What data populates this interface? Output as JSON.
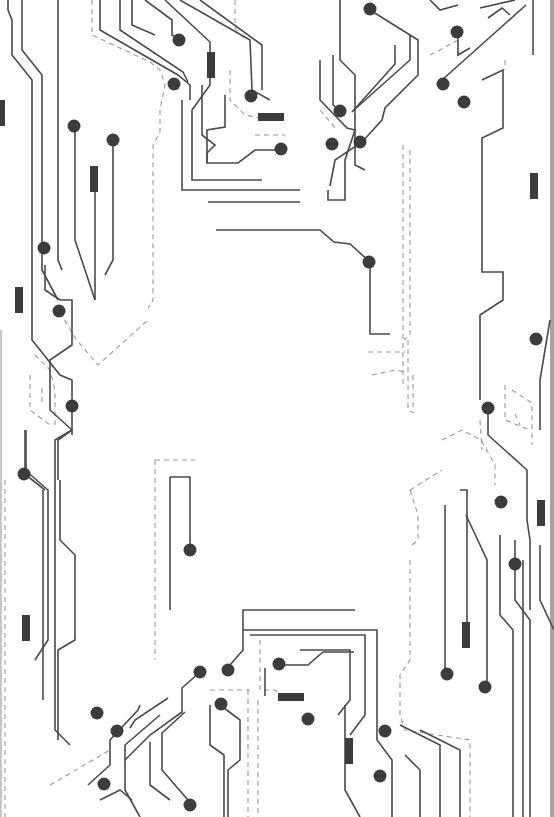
{
  "image": {
    "description": "Circuit board pattern decorative border",
    "width": 554,
    "height": 817,
    "colors": {
      "background": "#ffffff",
      "trace": "#4a4a4a",
      "dashed": "#9a9a9a",
      "node": "#3c3c3c"
    }
  },
  "traces": [
    "M22,0 L22,50 L42,75 L42,270 L58,300",
    "M8,0 L8,10 L12,20 L12,55 L32,80 L32,265",
    "M58,0 L58,260 L62,270",
    "M100,0 L100,30 L178,75 L190,85 L190,100",
    "M120,0 L120,30 L183,72 L188,82",
    "M132,0 L132,25 L155,35",
    "M145,0 L172,20 L172,35 L180,40",
    "M165,0 L210,42 L210,85 L192,110 L192,180 L262,180",
    "M180,0 L250,40 L252,90 L270,100",
    "M200,0 L262,45 L262,90",
    "M202,85 L202,135 L215,145 L207,153 L207,163 L238,163 L255,150 L282,150",
    "M225,95 L225,127 L207,130 L207,163",
    "M182,100 L182,190 L300,190",
    "M208,202 L300,202",
    "M216,230 L320,230 L334,242 L350,244 L370,262 L370,334 L390,334",
    "M75,126 L75,240 L95,300",
    "M113,140 L113,260 L105,275",
    "M95,180 L95,300",
    "M320,60 L320,100 L347,128 L355,130 L345,160 L345,200 L328,200 L328,190",
    "M333,55 L333,105 L345,115",
    "M340,0 L340,60 L355,75 L355,165 L365,170",
    "M370,10 L410,35 L410,60 L354,110",
    "M395,45 L395,64 L352,112",
    "M410,35 L418,40 L418,75 L385,108 L382,120 L362,142 L335,160 L330,186",
    "M442,80 L526,5",
    "M430,0 L440,10 L458,5",
    "M480,8 L515,0",
    "M488,18 L502,8 L510,15",
    "M458,30 L458,55 L470,48",
    "M533,0 L533,55",
    "M482,80 L503,70 L503,128 L482,138 L482,272 L503,272 L503,300 L480,315 L480,400",
    "M488,408 L488,435 L527,470 L527,520 L530,540 L530,610",
    "M550,320 L540,380 L540,430",
    "M45,265 L45,290 L60,300 L72,300 L72,345 L50,360 L50,410 L72,430 L72,435",
    "M32,265 L32,340 L60,375 L72,380 L72,430 L58,440 L58,480",
    "M72,430 L55,440 L55,730 L70,745",
    "M25,430 L25,470 L48,490 L48,640 L35,660",
    "M26,430 L26,475 L45,490",
    "M43,490 L43,700",
    "M60,480 L60,540 L75,555 L75,640 L58,650 L58,740",
    "M170,477 L190,477 L190,545",
    "M170,477 L170,610",
    "M230,665 L243,650 L243,610 L355,610",
    "M243,630 L377,630 L377,740 L392,760 L392,817",
    "M250,635 L365,635 L365,715 L350,735",
    "M300,650 L350,650 L350,700 L338,715",
    "M278,665 L308,665 L323,652 L354,652",
    "M265,696 L265,668",
    "M345,705 L345,790 L360,817",
    "M200,672 L182,688 L182,712 L150,735 L125,760",
    "M140,705 L138,710 L110,740 L110,765 L88,785",
    "M168,698 L135,720 L130,728",
    "M160,715 L125,745 L125,790 L140,817",
    "M150,742 L150,785 L170,800",
    "M185,712 L162,733 L162,770 L188,800",
    "M220,705 L240,720 L240,760 L228,770 L228,817",
    "M210,705 L210,745 L224,755 L224,817",
    "M100,800 L120,790 L132,800",
    "M400,725 L440,745 L440,817",
    "M405,755 L420,770 L420,817",
    "M420,730 L460,750 L460,817",
    "M445,505 L445,670",
    "M460,490 L467,490 L467,630",
    "M466,515 L487,560 L487,685",
    "M500,535 L500,615 L513,630 L513,817",
    "M515,540 L515,600 L530,620 L530,817",
    "M523,560 L523,817",
    "M540,545 L540,600 L554,630"
  ],
  "dashed_paths": [
    "M92,0 L92,35 L150,62 L160,70 L165,85 L160,110 L160,132 L153,145 L153,300 L148,308",
    "M235,0 L235,28 L245,40",
    "M230,70 L230,100 L245,115 L262,118",
    "M255,135 L285,135",
    "M60,312 L75,338 L98,365 L148,320",
    "M35,355 L50,370 L55,390 L55,425",
    "M30,375 L30,410 L50,425",
    "M42,388 L42,402",
    "M155,460 L195,460",
    "M155,460 L155,660",
    "M5,480 L5,817",
    "M320,110 L337,130",
    "M403,145 L403,385",
    "M410,150 L410,335 L404,340",
    "M408,340 L408,410 L418,415",
    "M368,352 L405,352",
    "M372,375 L395,370 L405,372",
    "M413,375 L413,410",
    "M442,440 L462,430 L481,440 L495,465 L495,485",
    "M410,490 L442,470",
    "M410,490 L418,515 L418,540 L412,545",
    "M505,385 L505,420 L530,430",
    "M512,390 L532,403 L532,445",
    "M515,414 L520,425",
    "M410,560 L410,660 L400,675 L400,715 L405,730 L470,740 L470,817",
    "M260,640 L260,690 L275,690 L285,700",
    "M248,690 L248,817",
    "M258,700 L258,817",
    "M50,785 L110,750",
    "M210,690 L250,690",
    "M480,420 L482,450",
    "M505,60 L505,70",
    "M430,55 L462,38"
  ],
  "nodes": [
    [
      179,
      40
    ],
    [
      370,
      9
    ],
    [
      457,
      32
    ],
    [
      174,
      84
    ],
    [
      251,
      96
    ],
    [
      340,
      111
    ],
    [
      443,
      84
    ],
    [
      464,
      102
    ],
    [
      74,
      126
    ],
    [
      113,
      140
    ],
    [
      281,
      149
    ],
    [
      332,
      144
    ],
    [
      360,
      142
    ],
    [
      44,
      248
    ],
    [
      369,
      262
    ],
    [
      59,
      311
    ],
    [
      536,
      339
    ],
    [
      72,
      406
    ],
    [
      488,
      408
    ],
    [
      24,
      474
    ],
    [
      501,
      502
    ],
    [
      515,
      564
    ],
    [
      190,
      550
    ],
    [
      200,
      672
    ],
    [
      228,
      670
    ],
    [
      279,
      664
    ],
    [
      447,
      674
    ],
    [
      485,
      687
    ],
    [
      97,
      713
    ],
    [
      221,
      704
    ],
    [
      308,
      719
    ],
    [
      117,
      731
    ],
    [
      385,
      731
    ],
    [
      104,
      784
    ],
    [
      190,
      805
    ],
    [
      380,
      776
    ]
  ],
  "resistors": [
    {
      "x": 207,
      "y": 52,
      "w": 8,
      "h": 26
    },
    {
      "x": 258,
      "y": 113,
      "w": 26,
      "h": 8
    },
    {
      "x": 90,
      "y": 166,
      "w": 8,
      "h": 26
    },
    {
      "x": 530,
      "y": 173,
      "w": 8,
      "h": 26
    },
    {
      "x": 15,
      "y": 287,
      "w": 8,
      "h": 26
    },
    {
      "x": 0,
      "y": 100,
      "w": 5,
      "h": 26
    },
    {
      "x": 537,
      "y": 500,
      "w": 8,
      "h": 26
    },
    {
      "x": 22,
      "y": 615,
      "w": 8,
      "h": 26
    },
    {
      "x": 462,
      "y": 622,
      "w": 8,
      "h": 26
    },
    {
      "x": 278,
      "y": 693,
      "w": 26,
      "h": 8
    },
    {
      "x": 345,
      "y": 738,
      "w": 8,
      "h": 26
    }
  ]
}
